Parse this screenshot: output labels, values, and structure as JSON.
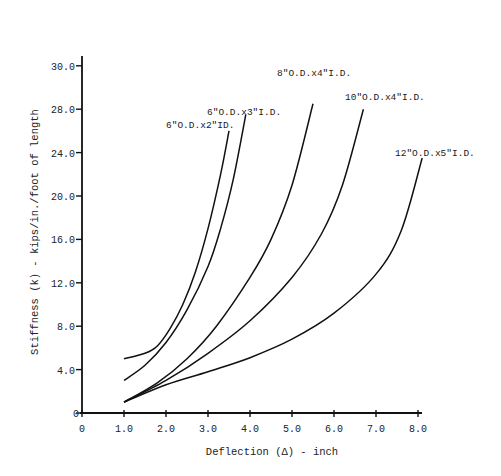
{
  "chart_data": {
    "type": "line",
    "title": "",
    "xlabel": "Deflection (Δ) - inch",
    "ylabel": "Stiffness (k) - kips/in./foot of length",
    "xlim": [
      0,
      8.0
    ],
    "ylim": [
      0,
      32
    ],
    "grid": false,
    "legend_position": "inline labels at curve ends",
    "x_ticks": [
      "0",
      "1.0",
      "2.0",
      "3.0",
      "4.0",
      "5.0",
      "6.0",
      "7.0",
      "8.0"
    ],
    "y_ticks": [
      "0",
      "4.0",
      "8.0",
      "12.0",
      "16.0",
      "20.0",
      "24.0",
      "28.0",
      "30.0"
    ],
    "series": [
      {
        "name": "6\"O.D.x2\"ID.",
        "x": [
          1.0,
          1.5,
          1.8,
          2.1,
          2.4,
          2.7,
          3.0,
          3.3,
          3.5
        ],
        "y": [
          5.0,
          5.5,
          6.2,
          7.8,
          10.0,
          13.0,
          17.0,
          22.0,
          26.0
        ]
      },
      {
        "name": "6\"O.D.x3\"I.D.",
        "x": [
          1.0,
          1.5,
          2.0,
          2.5,
          3.0,
          3.3,
          3.6,
          3.9
        ],
        "y": [
          3.0,
          4.4,
          6.5,
          9.5,
          13.5,
          17.0,
          21.5,
          27.5
        ]
      },
      {
        "name": "8\"O.D.x4\"I.D.",
        "x": [
          1.0,
          1.8,
          2.5,
          3.2,
          4.0,
          4.5,
          5.0,
          5.5
        ],
        "y": [
          1.0,
          2.8,
          5.0,
          8.0,
          12.5,
          16.0,
          21.0,
          28.5
        ]
      },
      {
        "name": "10\"O.D.x4\"I.D.",
        "x": [
          1.0,
          2.0,
          3.0,
          4.0,
          5.0,
          5.7,
          6.2,
          6.7
        ],
        "y": [
          1.0,
          3.0,
          5.5,
          8.5,
          12.5,
          16.5,
          21.0,
          28.0
        ]
      },
      {
        "name": "12\"O.D.x5\"I.D.",
        "x": [
          1.0,
          2.0,
          3.0,
          4.0,
          5.0,
          6.0,
          7.0,
          7.6,
          8.1
        ],
        "y": [
          1.0,
          2.6,
          3.8,
          5.1,
          6.8,
          9.2,
          12.8,
          16.8,
          23.5
        ]
      }
    ]
  }
}
